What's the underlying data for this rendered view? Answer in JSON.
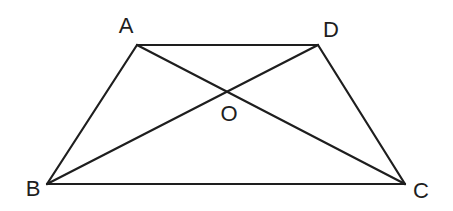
{
  "diagram": {
    "type": "trapezoid-with-diagonals",
    "points": {
      "A": {
        "label": "A",
        "x": 137,
        "y": 45,
        "label_x": 126,
        "label_y": 33
      },
      "D": {
        "label": "D",
        "x": 318,
        "y": 45,
        "label_x": 331,
        "label_y": 37
      },
      "B": {
        "label": "B",
        "x": 47,
        "y": 184,
        "label_x": 33,
        "label_y": 196
      },
      "C": {
        "label": "C",
        "x": 405,
        "y": 184,
        "label_x": 421,
        "label_y": 198
      },
      "O": {
        "label": "O",
        "x": 229,
        "y": 91,
        "label_x": 229,
        "label_y": 121
      }
    },
    "segments": [
      {
        "name": "AD",
        "from": "A",
        "to": "D"
      },
      {
        "name": "AB",
        "from": "A",
        "to": "B"
      },
      {
        "name": "DC",
        "from": "D",
        "to": "C"
      },
      {
        "name": "BC",
        "from": "B",
        "to": "C"
      },
      {
        "name": "AC",
        "from": "A",
        "to": "C"
      },
      {
        "name": "BD",
        "from": "B",
        "to": "D"
      }
    ],
    "colors": {
      "stroke": "#1e1e1e",
      "background": "#ffffff"
    }
  }
}
